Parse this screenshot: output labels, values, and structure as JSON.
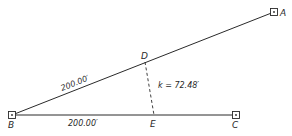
{
  "diagram": {
    "points": {
      "A": {
        "label": "A",
        "x": 274,
        "y": 12
      },
      "B": {
        "label": "B",
        "x": 12,
        "y": 115
      },
      "C": {
        "label": "C",
        "x": 236,
        "y": 115
      },
      "D": {
        "label": "D",
        "x": 145,
        "y": 62
      },
      "E": {
        "label": "E",
        "x": 154,
        "y": 115
      }
    },
    "dimensions": {
      "BD": "200.00′",
      "BE": "200.00′",
      "DE": "k = 72.48′"
    },
    "colors": {
      "line": "#2a2a2a",
      "background": "#ffffff"
    }
  }
}
